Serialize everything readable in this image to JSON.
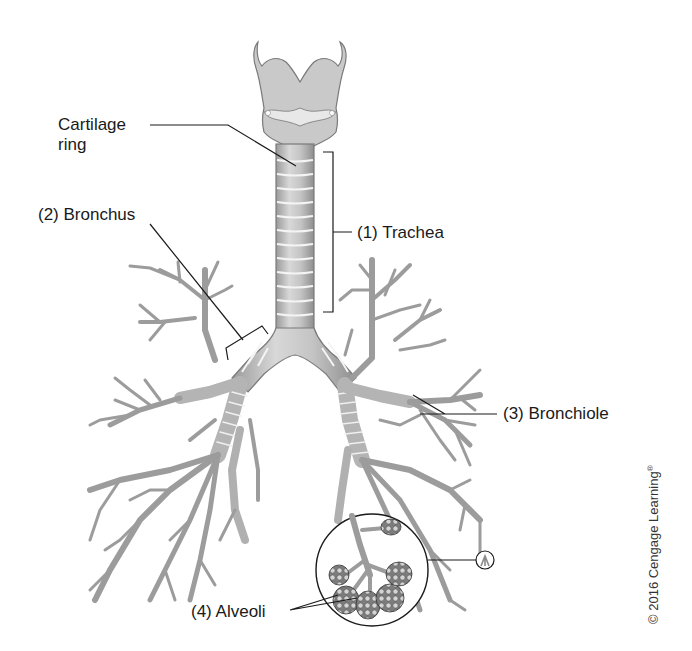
{
  "figure": {
    "labels": {
      "cartilage_ring_line1": "Cartilage",
      "cartilage_ring_line2": "ring",
      "trachea": "(1) Trachea",
      "bronchus": "(2) Bronchus",
      "bronchiole": "(3) Bronchiole",
      "alveoli": "(4) Alveoli",
      "callout_marker": "A"
    },
    "copyright": "© 2016 Cengage Learning",
    "copyright_mark": "®"
  },
  "colors": {
    "background": "#ffffff",
    "tube_fill": "#bdbdbd",
    "tube_stroke": "#7a7a7a",
    "ring_line": "#f2f2f2",
    "leader_line": "#1a1a1a",
    "alveoli_fill": "#8a8a8a"
  }
}
